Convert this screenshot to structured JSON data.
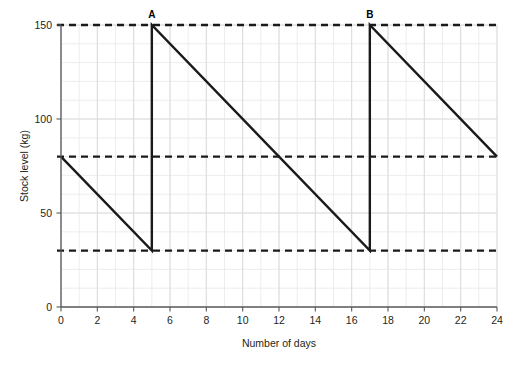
{
  "chart_data": {
    "type": "line",
    "title": "",
    "xlabel": "Number of days",
    "ylabel": "Stock level (kg)",
    "xlim": [
      0,
      24
    ],
    "ylim": [
      0,
      150
    ],
    "xticks": [
      0,
      2,
      4,
      6,
      8,
      10,
      12,
      14,
      16,
      18,
      20,
      22,
      24
    ],
    "yticks": [
      0,
      50,
      100,
      150
    ],
    "xtick_labels": [
      "0",
      "2",
      "4",
      "6",
      "8",
      "10",
      "12",
      "14",
      "16",
      "18",
      "20",
      "22",
      "24"
    ],
    "ytick_labels": [
      "0",
      "50",
      "100",
      "150"
    ],
    "grid": true,
    "grid_minor_x_step": 1,
    "grid_minor_y_step": 10,
    "legend": "none",
    "series": [
      {
        "name": "Stock level",
        "style": "solid",
        "color": "#1a1a1a",
        "x": [
          0,
          5,
          5,
          17,
          17,
          24
        ],
        "y": [
          80,
          30,
          150,
          30,
          150,
          80
        ]
      }
    ],
    "reference_lines": [
      {
        "name": "maximum-stock-level",
        "value": 150,
        "style": "dashed",
        "color": "#1a1a1a"
      },
      {
        "name": "reorder-level",
        "value": 80,
        "style": "dashed",
        "color": "#1a1a1a"
      },
      {
        "name": "buffer-stock-level",
        "value": 30,
        "style": "dashed",
        "color": "#1a1a1a"
      }
    ],
    "annotations": [
      {
        "label": "A",
        "x": 5,
        "y": 150
      },
      {
        "label": "B",
        "x": 17,
        "y": 150
      }
    ]
  }
}
